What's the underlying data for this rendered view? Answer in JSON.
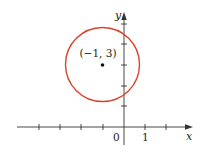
{
  "diagram": {
    "type": "circle-on-coordinate-plane",
    "center_label": "(−1, 3)",
    "center": [
      -1,
      3
    ],
    "radius": 1.732,
    "axes": {
      "x_label": "x",
      "y_label": "y",
      "origin_label": "0",
      "x_tick_label": "1",
      "x_ticks": [
        -5,
        -4,
        -3,
        -2,
        -1,
        1,
        2
      ],
      "y_ticks": [
        1,
        2,
        3,
        4,
        5
      ]
    },
    "colors": {
      "circle": "#d9442c",
      "axes": "#333333",
      "point": "#111111"
    }
  }
}
